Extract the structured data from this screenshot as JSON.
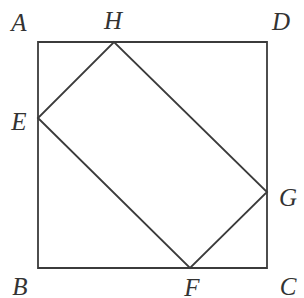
{
  "figure": {
    "background_color": "#ffffff",
    "stroke_color": "#3b3b3b",
    "label_color": "#333333",
    "stroke_width": 1.8,
    "canvas": {
      "width": 304,
      "height": 298
    }
  },
  "shapes": {
    "outer_square": {
      "name": "ABCD",
      "points": "38,42 267,42 267,268 38,268",
      "corners": {
        "A": {
          "x": 38,
          "y": 42
        },
        "D": {
          "x": 267,
          "y": 42
        },
        "C": {
          "x": 267,
          "y": 268
        },
        "B": {
          "x": 38,
          "y": 268
        }
      },
      "side_length": 229
    },
    "inner_rectangle": {
      "name": "EFGH",
      "points": "38,118 190,268 267,192 114,42",
      "corners": {
        "E": {
          "x": 38,
          "y": 118
        },
        "F": {
          "x": 190,
          "y": 268
        },
        "G": {
          "x": 267,
          "y": 192
        },
        "H": {
          "x": 114,
          "y": 42
        }
      }
    }
  },
  "labels": [
    {
      "id": "A",
      "text": "A",
      "x": 19,
      "y": 22,
      "anchor": "outer-corner-top-left"
    },
    {
      "id": "H",
      "text": "H",
      "x": 113,
      "y": 20,
      "anchor": "inner-vertex-top"
    },
    {
      "id": "D",
      "text": "D",
      "x": 281,
      "y": 21,
      "anchor": "outer-corner-top-right"
    },
    {
      "id": "E",
      "text": "E",
      "x": 19,
      "y": 121,
      "anchor": "inner-vertex-left"
    },
    {
      "id": "G",
      "text": "G",
      "x": 288,
      "y": 197,
      "anchor": "inner-vertex-right"
    },
    {
      "id": "B",
      "text": "B",
      "x": 20,
      "y": 286,
      "anchor": "outer-corner-bottom-left"
    },
    {
      "id": "F",
      "text": "F",
      "x": 192,
      "y": 287,
      "anchor": "inner-vertex-bottom"
    },
    {
      "id": "C",
      "text": "C",
      "x": 288,
      "y": 286,
      "anchor": "outer-corner-bottom-right"
    }
  ]
}
